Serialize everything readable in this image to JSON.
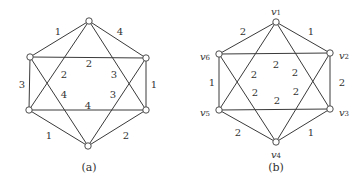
{
  "colors": {
    "stroke": "#3a3a3a",
    "text": "#333333",
    "background": "#ffffff"
  },
  "graph_a": {
    "caption": "(a)",
    "nodes": [
      {
        "id": "top",
        "x": 89,
        "y": 21
      },
      {
        "id": "upper-right",
        "x": 146,
        "y": 58
      },
      {
        "id": "lower-right",
        "x": 146,
        "y": 110
      },
      {
        "id": "bottom",
        "x": 88,
        "y": 146
      },
      {
        "id": "lower-left",
        "x": 29,
        "y": 110
      },
      {
        "id": "upper-left",
        "x": 30,
        "y": 57
      }
    ],
    "edges": [
      {
        "from": 0,
        "to": 5,
        "weight": "1",
        "lx": 58,
        "ly": 31
      },
      {
        "from": 0,
        "to": 1,
        "weight": "4",
        "lx": 120,
        "ly": 31
      },
      {
        "from": 5,
        "to": 4,
        "weight": "3",
        "lx": 22,
        "ly": 84
      },
      {
        "from": 1,
        "to": 2,
        "weight": "1",
        "lx": 154,
        "ly": 84
      },
      {
        "from": 4,
        "to": 3,
        "weight": "1",
        "lx": 49,
        "ly": 135
      },
      {
        "from": 2,
        "to": 3,
        "weight": "2",
        "lx": 126,
        "ly": 135
      },
      {
        "from": 5,
        "to": 1,
        "weight": "2",
        "lx": 89,
        "ly": 63
      },
      {
        "from": 4,
        "to": 2,
        "weight": "4",
        "lx": 88,
        "ly": 105
      },
      {
        "from": 0,
        "to": 4,
        "weight": "2",
        "lx": 64,
        "ly": 74
      },
      {
        "from": 0,
        "to": 2,
        "weight": "3",
        "lx": 114,
        "ly": 74
      },
      {
        "from": 5,
        "to": 3,
        "weight": "4",
        "lx": 64,
        "ly": 94
      },
      {
        "from": 1,
        "to": 3,
        "weight": "3",
        "lx": 113,
        "ly": 94
      }
    ]
  },
  "graph_b": {
    "caption": "(b)",
    "nodes": [
      {
        "id": "v1",
        "name": "v",
        "sub": "1",
        "x": 276,
        "y": 22,
        "lx": 276,
        "ly": 11
      },
      {
        "id": "v2",
        "name": "v",
        "sub": "2",
        "x": 330,
        "y": 53,
        "lx": 344,
        "ly": 55
      },
      {
        "id": "v3",
        "name": "v",
        "sub": "3",
        "x": 330,
        "y": 109,
        "lx": 344,
        "ly": 112
      },
      {
        "id": "v4",
        "name": "v",
        "sub": "4",
        "x": 276,
        "y": 142,
        "lx": 276,
        "ly": 154
      },
      {
        "id": "v5",
        "name": "v",
        "sub": "5",
        "x": 219,
        "y": 110,
        "lx": 205,
        "ly": 112
      },
      {
        "id": "v6",
        "name": "v",
        "sub": "6",
        "x": 219,
        "y": 54,
        "lx": 205,
        "ly": 56
      }
    ],
    "edges": [
      {
        "from": 0,
        "to": 5,
        "weight": "2",
        "lx": 243,
        "ly": 31
      },
      {
        "from": 0,
        "to": 1,
        "weight": "1",
        "lx": 311,
        "ly": 31
      },
      {
        "from": 5,
        "to": 4,
        "weight": "1",
        "lx": 212,
        "ly": 82
      },
      {
        "from": 1,
        "to": 2,
        "weight": "2",
        "lx": 342,
        "ly": 82
      },
      {
        "from": 4,
        "to": 3,
        "weight": "2",
        "lx": 238,
        "ly": 132
      },
      {
        "from": 2,
        "to": 3,
        "weight": "1",
        "lx": 311,
        "ly": 132
      },
      {
        "from": 5,
        "to": 1,
        "weight": "2",
        "lx": 276,
        "ly": 64
      },
      {
        "from": 4,
        "to": 2,
        "weight": "2",
        "lx": 277,
        "ly": 100
      },
      {
        "from": 0,
        "to": 4,
        "weight": "2",
        "lx": 254,
        "ly": 74
      },
      {
        "from": 0,
        "to": 2,
        "weight": "2",
        "lx": 295,
        "ly": 72
      },
      {
        "from": 5,
        "to": 3,
        "weight": "2",
        "lx": 255,
        "ly": 92
      },
      {
        "from": 1,
        "to": 3,
        "weight": "2",
        "lx": 296,
        "ly": 91
      }
    ]
  }
}
